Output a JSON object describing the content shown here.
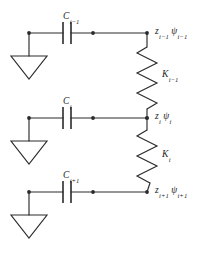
{
  "figure": {
    "type": "electrical-circuit-schematic",
    "stroke_color": "#2b2b2b",
    "background_color": "#ffffff",
    "text_color": "#1c1c1c"
  },
  "branches": [
    {
      "id": "branch-upper",
      "capacitor": {
        "symbol": "C",
        "subscript": "i−1"
      },
      "node": {
        "displacement": {
          "symbol": "z",
          "subscript": "i−1"
        },
        "potential": {
          "symbol": "ψ",
          "subscript": "i−1"
        }
      }
    },
    {
      "id": "branch-middle",
      "capacitor": {
        "symbol": "C",
        "subscript": "i"
      },
      "node": {
        "displacement": {
          "symbol": "z",
          "subscript": "i"
        },
        "potential": {
          "symbol": "ψ",
          "subscript": "i"
        }
      }
    },
    {
      "id": "branch-lower",
      "capacitor": {
        "symbol": "C",
        "subscript": "i+1"
      },
      "node": {
        "displacement": {
          "symbol": "z",
          "subscript": "i+1"
        },
        "potential": {
          "symbol": "ψ",
          "subscript": "i+1"
        }
      }
    }
  ],
  "springs": [
    {
      "id": "spring-upper",
      "symbol": "K",
      "subscript": "i−1"
    },
    {
      "id": "spring-lower",
      "symbol": "K",
      "subscript": "i"
    }
  ],
  "icons": {
    "ground": "ground-triangle-icon",
    "capacitor": "capacitor-icon",
    "spring": "spring-zigzag-icon",
    "junction": "junction-dot-icon"
  }
}
